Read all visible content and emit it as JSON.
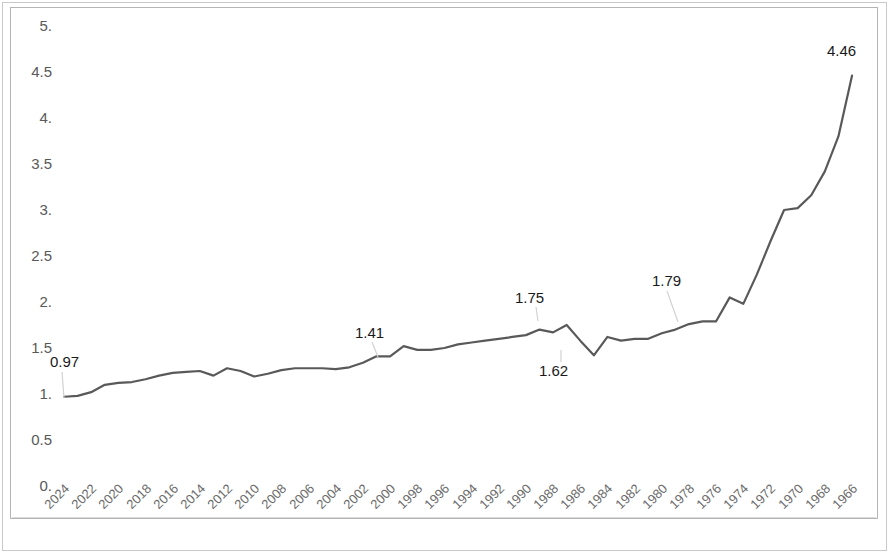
{
  "chart_data": {
    "type": "line",
    "title": "",
    "xlabel": "",
    "ylabel": "",
    "grid": false,
    "legend": "none",
    "xlim": [
      2024,
      1966
    ],
    "ylim": [
      0,
      5
    ],
    "x_tick_labels": [
      "2024",
      "2022",
      "2020",
      "2018",
      "2016",
      "2014",
      "2012",
      "2010",
      "2008",
      "2006",
      "2004",
      "2002",
      "2000",
      "1998",
      "1996",
      "1994",
      "1992",
      "1990",
      "1988",
      "1986",
      "1984",
      "1982",
      "1980",
      "1978",
      "1976",
      "1974",
      "1972",
      "1970",
      "1968",
      "1966"
    ],
    "y_tick_labels": [
      "5.",
      "4.5",
      "4.",
      "3.5",
      "3.",
      "2.5",
      "2.",
      "1.5",
      "1.",
      "0.5",
      "0."
    ],
    "y_tick_values": [
      5,
      4.5,
      4,
      3.5,
      3,
      2.5,
      2,
      1.5,
      1,
      0.5,
      0
    ],
    "series": [
      {
        "name": "value",
        "color": "#595959",
        "x": [
          2024,
          2023,
          2022,
          2021,
          2020,
          2019,
          2018,
          2017,
          2016,
          2015,
          2014,
          2013,
          2012,
          2011,
          2010,
          2009,
          2008,
          2007,
          2006,
          2005,
          2004,
          2003,
          2002,
          2001,
          2000,
          1999,
          1998,
          1997,
          1996,
          1995,
          1994,
          1993,
          1992,
          1991,
          1990,
          1989,
          1988,
          1987,
          1986,
          1985,
          1984,
          1983,
          1982,
          1981,
          1980,
          1979,
          1978,
          1977,
          1976,
          1975,
          1974,
          1973,
          1972,
          1971,
          1970,
          1969,
          1968,
          1967,
          1966
        ],
        "values": [
          0.97,
          0.98,
          1.02,
          1.1,
          1.12,
          1.13,
          1.16,
          1.2,
          1.23,
          1.24,
          1.25,
          1.2,
          1.28,
          1.25,
          1.19,
          1.22,
          1.26,
          1.28,
          1.28,
          1.28,
          1.27,
          1.29,
          1.34,
          1.41,
          1.41,
          1.52,
          1.48,
          1.48,
          1.5,
          1.54,
          1.56,
          1.58,
          1.6,
          1.62,
          1.64,
          1.7,
          1.67,
          1.75,
          1.58,
          1.42,
          1.62,
          1.58,
          1.6,
          1.6,
          1.66,
          1.7,
          1.76,
          1.79,
          1.79,
          2.05,
          1.98,
          2.3,
          2.66,
          3.0,
          3.02,
          3.16,
          3.42,
          3.8,
          4.46
        ]
      }
    ],
    "point_labels": [
      {
        "text": "0.97",
        "x": 2024,
        "value": 0.97,
        "label_left": 50,
        "label_top": 354,
        "leader": {
          "x1": 62,
          "y1": 372,
          "x2": 64,
          "y2": 398
        }
      },
      {
        "text": "1.41",
        "x": 2001,
        "value": 1.41,
        "label_left": 355,
        "label_top": 325,
        "leader": {
          "x1": 372,
          "y1": 342,
          "x2": 378,
          "y2": 357
        }
      },
      {
        "text": "1.75",
        "x": 1987,
        "value": 1.75,
        "label_left": 515,
        "label_top": 290,
        "leader": {
          "x1": 536,
          "y1": 307,
          "x2": 538,
          "y2": 321
        }
      },
      {
        "text": "1.62",
        "x": 1984,
        "value": 1.62,
        "label_left": 539,
        "label_top": 363,
        "leader": {
          "x1": 561,
          "y1": 362,
          "x2": 561,
          "y2": 350
        }
      },
      {
        "text": "1.79",
        "x": 1977,
        "value": 1.79,
        "label_left": 652,
        "label_top": 273,
        "leader": {
          "x1": 667,
          "y1": 291,
          "x2": 678,
          "y2": 322
        }
      },
      {
        "text": "4.46",
        "x": 1966,
        "value": 4.46,
        "label_left": 827,
        "label_top": 43,
        "leader": null
      }
    ]
  }
}
